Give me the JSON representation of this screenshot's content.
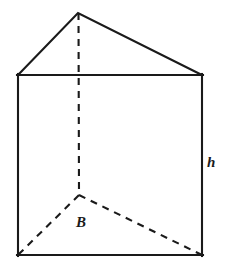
{
  "figure": {
    "name": "triangular-prism",
    "canvas": {
      "width": 230,
      "height": 272
    },
    "background_color": "#ffffff",
    "stroke_color": "#1a1a1a",
    "stroke_width": 2.1,
    "hidden_edge_dash": "7 6"
  },
  "vertices": {
    "apex_front_top": {
      "x": 78,
      "y": 13
    },
    "top_left": {
      "x": 18,
      "y": 75
    },
    "top_right": {
      "x": 202,
      "y": 75
    },
    "bottom_left": {
      "x": 18,
      "y": 255
    },
    "bottom_right": {
      "x": 202,
      "y": 255
    },
    "hidden_back_bottom": {
      "x": 79,
      "y": 195
    }
  },
  "edges": {
    "solid": [
      {
        "name": "top-face-left-slant",
        "from": "top_left",
        "to": "apex_front_top"
      },
      {
        "name": "top-face-right-slant",
        "from": "apex_front_top",
        "to": "top_right"
      },
      {
        "name": "top-face-front-edge",
        "from": "top_left",
        "to": "top_right"
      },
      {
        "name": "left-vertical-edge",
        "from": "top_left",
        "to": "bottom_left"
      },
      {
        "name": "right-vertical-edge",
        "from": "top_right",
        "to": "bottom_right"
      },
      {
        "name": "bottom-front-edge",
        "from": "bottom_left",
        "to": "bottom_right"
      }
    ],
    "dashed": [
      {
        "name": "hidden-vertical-edge",
        "from": "apex_front_top",
        "to": "hidden_back_bottom"
      },
      {
        "name": "hidden-base-left-edge",
        "from": "hidden_back_bottom",
        "to": "bottom_left"
      },
      {
        "name": "hidden-base-right-edge",
        "from": "hidden_back_bottom",
        "to": "bottom_right"
      }
    ]
  },
  "labels": {
    "base": {
      "text": "B",
      "meaning": "area of the triangular base",
      "x": 82,
      "y": 223
    },
    "height": {
      "text": "h",
      "meaning": "height of the prism",
      "x": 211,
      "y": 163
    }
  }
}
